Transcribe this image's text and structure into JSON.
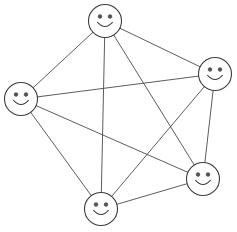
{
  "diagram": {
    "type": "complete-graph",
    "graph_name": "K5",
    "node_count": "5",
    "edge_count": "10",
    "background_color": "#ffffff",
    "edge_color": "#4a4a4a",
    "node_fill_color": "#ffffff",
    "node_stroke_color": "#3c3c3c",
    "eye_color": "#565656",
    "node_radius": 16.5,
    "eye_radius": 1.9,
    "eye_offset_x": 5.0,
    "eye_offset_y": -4.5,
    "mouth_path": "m -7.4 1.4 q 7.4 8.2 14.8 0",
    "nodes": [
      {
        "id": "node-top",
        "label": "Top",
        "cx": 105,
        "cy": 21
      },
      {
        "id": "node-left",
        "label": "Left",
        "cx": 21,
        "cy": 99
      },
      {
        "id": "node-right",
        "label": "Right",
        "cx": 215,
        "cy": 74
      },
      {
        "id": "node-bottom-right",
        "label": "Bottom Right",
        "cx": 203,
        "cy": 179
      },
      {
        "id": "node-bottom",
        "label": "Bottom",
        "cx": 101,
        "cy": 209
      }
    ],
    "edges": [
      {
        "id": "edge-top-left",
        "from": "node-top",
        "to": "node-left"
      },
      {
        "id": "edge-top-right",
        "from": "node-top",
        "to": "node-right"
      },
      {
        "id": "edge-top-bottom-right",
        "from": "node-top",
        "to": "node-bottom-right"
      },
      {
        "id": "edge-top-bottom",
        "from": "node-top",
        "to": "node-bottom"
      },
      {
        "id": "edge-left-right",
        "from": "node-left",
        "to": "node-right"
      },
      {
        "id": "edge-left-bottom-right",
        "from": "node-left",
        "to": "node-bottom-right"
      },
      {
        "id": "edge-left-bottom",
        "from": "node-left",
        "to": "node-bottom"
      },
      {
        "id": "edge-right-bottom-right",
        "from": "node-right",
        "to": "node-bottom-right"
      },
      {
        "id": "edge-right-bottom",
        "from": "node-right",
        "to": "node-bottom"
      },
      {
        "id": "edge-bottom-right-bottom",
        "from": "node-bottom-right",
        "to": "node-bottom"
      }
    ]
  }
}
